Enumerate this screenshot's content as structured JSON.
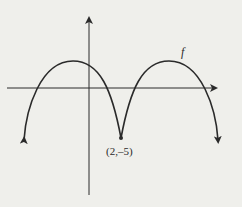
{
  "diagram": {
    "function_label": "f",
    "point_label": "(2,–5)",
    "point": {
      "x": 2,
      "y": -5
    },
    "colors": {
      "curve": "#2a2a2a",
      "background": "#efefeb"
    }
  }
}
